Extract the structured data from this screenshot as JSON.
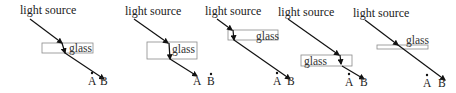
{
  "figure": {
    "type": "light refraction through glass slab - five answer options",
    "colors": {
      "ray": "#111111",
      "glass_border": "#8a8a8a",
      "text": "#222222"
    },
    "panels": [
      {
        "id": 1,
        "source_label": "light source",
        "glass_label": "glass",
        "point_a_label": "A",
        "point_b_label": "B",
        "ray_path": "bends inside glass (steeper), exits parallel, arrives at B"
      },
      {
        "id": 2,
        "source_label": "light source",
        "glass_label": "glass",
        "point_a_label": "A",
        "point_b_label": "B",
        "ray_path": "vertical inside glass, exits toward A"
      },
      {
        "id": 3,
        "source_label": "light source",
        "glass_label": "glass",
        "point_a_label": "A",
        "point_b_label": "B",
        "ray_path": "bends inside thin glass, exits parallel, arrives at B"
      },
      {
        "id": 4,
        "source_label": "light source",
        "glass_label": "glass",
        "point_a_label": "A",
        "point_b_label": "B",
        "ray_path": "bends inside glass, exits parallel, arrives at B"
      },
      {
        "id": 5,
        "source_label": "light source",
        "glass_label": "glass",
        "point_a_label": "A",
        "point_b_label": "B",
        "ray_path": "straight line through glass, arrives at B"
      }
    ]
  }
}
